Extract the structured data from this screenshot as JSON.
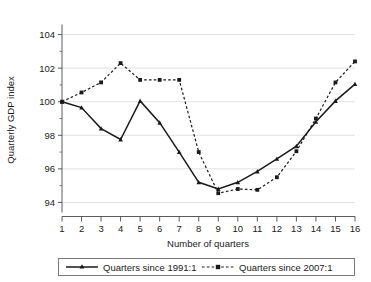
{
  "chart_data": {
    "type": "line",
    "title": "",
    "xlabel": "Number of quarters",
    "ylabel": "Quarterly GDP index",
    "x": [
      1,
      2,
      3,
      4,
      5,
      6,
      7,
      8,
      9,
      10,
      11,
      12,
      13,
      14,
      15,
      16
    ],
    "xtick_labels": [
      "1",
      "2",
      "3",
      "4",
      "5",
      "6",
      "7",
      "8",
      "9",
      "10",
      "11",
      "12",
      "13",
      "14",
      "15",
      "16"
    ],
    "xlim": [
      1,
      16
    ],
    "ylim": [
      93.4,
      104.6
    ],
    "ytick_labels": [
      "94",
      "96",
      "98",
      "100",
      "102",
      "104"
    ],
    "yticks": [
      94,
      96,
      98,
      100,
      102,
      104
    ],
    "y_minor_ticks": [
      95,
      97,
      99,
      101,
      103
    ],
    "grid": "horizontal",
    "legend_position": "below-axis",
    "series": [
      {
        "name": "Quarters since 1991:1",
        "style": "solid",
        "marker": "triangle",
        "color": "#1a1a1a",
        "values": [
          100.0,
          99.65,
          98.4,
          97.75,
          100.05,
          98.75,
          97.0,
          95.2,
          94.8,
          95.2,
          95.85,
          96.6,
          97.35,
          98.8,
          100.05,
          101.05
        ]
      },
      {
        "name": "Quarters since 2007:1",
        "style": "dashed",
        "marker": "square",
        "color": "#1a1a1a",
        "values": [
          100.0,
          100.55,
          101.15,
          102.3,
          101.3,
          101.3,
          101.3,
          97.0,
          94.55,
          94.8,
          94.75,
          95.5,
          97.05,
          99.0,
          101.15,
          102.4
        ]
      }
    ]
  },
  "legend": {
    "entries": [
      {
        "label": "Quarters since 1991:1"
      },
      {
        "label": "Quarters since 2007:1"
      }
    ]
  }
}
